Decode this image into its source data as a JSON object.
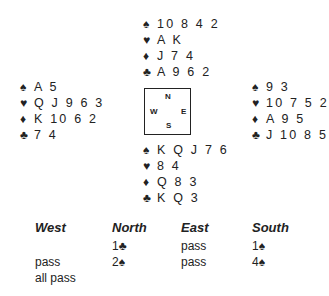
{
  "deal": {
    "north": {
      "spades": "10 8 4 2",
      "hearts": "A K",
      "diamonds": "J 7 4",
      "clubs": "A 9 6 2"
    },
    "west": {
      "spades": "A 5",
      "hearts": "Q J 9 6 3",
      "diamonds": "K 10 6 2",
      "clubs": "7 4"
    },
    "east": {
      "spades": "9 3",
      "hearts": "10 7 5 2",
      "diamonds": "A 9 5",
      "clubs": "J 10 8 5"
    },
    "south": {
      "spades": "K Q J 7 6",
      "hearts": "8 4",
      "diamonds": "Q 8 3",
      "clubs": "K Q 3"
    }
  },
  "suits": {
    "spades": "♠",
    "hearts": "♥",
    "diamonds": "♦",
    "clubs": "♣"
  },
  "compass": {
    "n": "N",
    "e": "E",
    "s": "S",
    "w": "W"
  },
  "bidding": {
    "headers": [
      "West",
      "North",
      "East",
      "South"
    ],
    "rows": [
      [
        "",
        "1♣",
        "pass",
        "1♠"
      ],
      [
        "pass",
        "2♠",
        "pass",
        "4♠"
      ],
      [
        "all pass",
        "",
        "",
        ""
      ]
    ]
  }
}
